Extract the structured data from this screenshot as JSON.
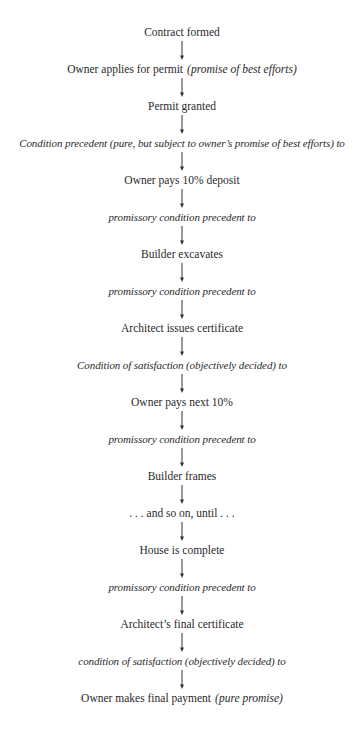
{
  "diagram": {
    "arrow_icon": "down-arrow",
    "nodes": [
      {
        "text": "Contract formed",
        "note": "",
        "style": "roman"
      },
      {
        "text": "Owner applies for permit",
        "note": "(promise of best efforts)",
        "style": "roman"
      },
      {
        "text": "Permit granted",
        "note": "",
        "style": "roman"
      },
      {
        "text": "Condition precedent (pure, but subject to owner’s promise of best efforts) to",
        "note": "",
        "style": "italic"
      },
      {
        "text": "Owner pays 10% deposit",
        "note": "",
        "style": "roman"
      },
      {
        "text": "promissory condition precedent to",
        "note": "",
        "style": "italic"
      },
      {
        "text": "Builder excavates",
        "note": "",
        "style": "roman"
      },
      {
        "text": "promissory condition precedent to",
        "note": "",
        "style": "italic"
      },
      {
        "text": "Architect issues certificate",
        "note": "",
        "style": "roman"
      },
      {
        "text": "Condition of satisfaction (objectively decided) to",
        "note": "",
        "style": "italic"
      },
      {
        "text": "Owner pays next 10%",
        "note": "",
        "style": "roman"
      },
      {
        "text": "promissory condition precedent to",
        "note": "",
        "style": "italic"
      },
      {
        "text": "Builder frames",
        "note": "",
        "style": "roman"
      },
      {
        "text": ". . . and so on, until . . .",
        "note": "",
        "style": "roman"
      },
      {
        "text": "House is complete",
        "note": "",
        "style": "roman"
      },
      {
        "text": "promissory condition precedent to",
        "note": "",
        "style": "italic"
      },
      {
        "text": "Architect’s final certificate",
        "note": "",
        "style": "roman"
      },
      {
        "text": "condition of satisfaction (objectively decided) to",
        "note": "",
        "style": "italic"
      },
      {
        "text": "Owner makes final payment",
        "note": "(pure promise)",
        "style": "roman"
      }
    ]
  }
}
